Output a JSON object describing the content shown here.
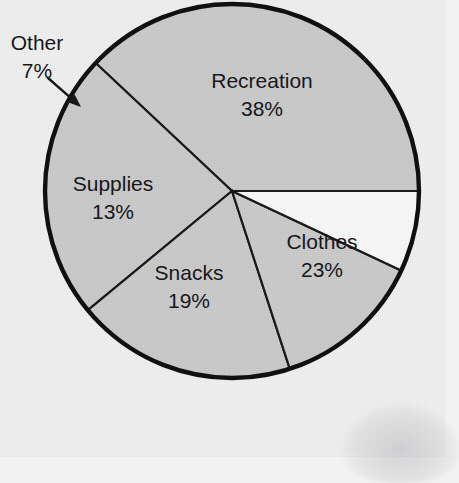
{
  "chart_data": {
    "type": "pie",
    "title": "",
    "subtitle": "",
    "xlabel": "",
    "ylabel": "",
    "legend_position": "none",
    "grid": false,
    "value_unit": "%",
    "total": 100,
    "start_angle_deg": 0,
    "direction": "counterclockwise",
    "categories": [
      "Recreation",
      "Clothes",
      "Snacks",
      "Supplies",
      "Other"
    ],
    "values": [
      38,
      23,
      19,
      13,
      7
    ],
    "slices": [
      {
        "name": "Recreation",
        "label": "Recreation",
        "value": 38,
        "value_label": "38%",
        "fill": "#cdcdcd",
        "label_placement": "inside",
        "label_x": 262,
        "label_y": 90
      },
      {
        "name": "Clothes",
        "label": "Clothes",
        "value": 23,
        "value_label": "23%",
        "fill": "#cdcdcd",
        "label_placement": "inside",
        "label_x": 322,
        "label_y": 251
      },
      {
        "name": "Snacks",
        "label": "Snacks",
        "value": 19,
        "value_label": "19%",
        "fill": "#cdcdcd",
        "label_placement": "inside",
        "label_x": 189,
        "label_y": 282
      },
      {
        "name": "Supplies",
        "label": "Supplies",
        "value": 13,
        "value_label": "13%",
        "fill": "#cdcdcd",
        "label_placement": "inside",
        "label_x": 113,
        "label_y": 192
      },
      {
        "name": "Other",
        "label": "Other",
        "value": 7,
        "value_label": "7%",
        "fill": "#fbfbfb",
        "label_placement": "callout",
        "label_x": 37,
        "label_y": 44
      }
    ],
    "annotations": [
      {
        "name": "other-callout-arrow",
        "type": "arrow",
        "from_x": 48,
        "from_y": 78,
        "to_x": 81,
        "to_y": 107,
        "points_to": "Other"
      }
    ],
    "geometry": {
      "center_x": 232,
      "center_y": 191,
      "radius": 187
    },
    "colors": {
      "background": "#f2f2f2",
      "slice_fill": "#cdcdcd",
      "other_fill": "#fbfbfb",
      "outline": "#111111",
      "divider": "#1a1a1a",
      "text": "#17181a"
    }
  }
}
